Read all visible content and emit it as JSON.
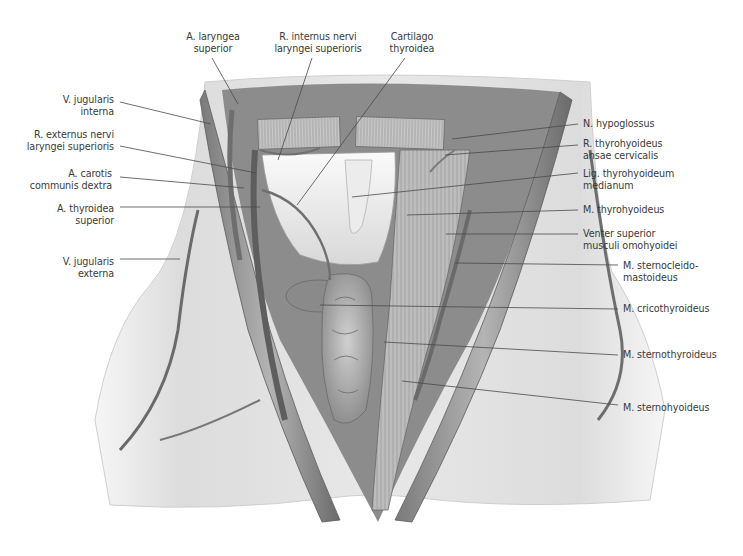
{
  "figure": {
    "colors": {
      "background": "#ffffff",
      "label_text": "#3a3a3a",
      "leader_line": "#4a4a4a",
      "skin": "#e6e6e6",
      "muscle": "#9a9a9a",
      "vessel": "#6e6e6e",
      "thyroid_gland": "#a8a8a8",
      "cartilage": "#f2f2f2"
    }
  },
  "labels": {
    "top": [
      {
        "id": "a-laryngea-superior",
        "lines": [
          "A. laryngea",
          "superior"
        ]
      },
      {
        "id": "r-internus-nervi",
        "lines": [
          "R. internus nervi",
          "laryngei superioris"
        ]
      },
      {
        "id": "cartilago-thyroidea",
        "lines": [
          "Cartilago",
          "thyroidea"
        ]
      }
    ],
    "left": [
      {
        "id": "v-jugularis-interna",
        "lines": [
          "V. jugularis",
          "interna"
        ]
      },
      {
        "id": "r-externus-nervi",
        "lines": [
          "R. externus nervi",
          "laryngei superioris"
        ]
      },
      {
        "id": "a-carotis-communis",
        "lines": [
          "A. carotis",
          "communis dextra"
        ]
      },
      {
        "id": "a-thyroidea-superior",
        "lines": [
          "A. thyroidea",
          "superior"
        ]
      },
      {
        "id": "v-jugularis-externa",
        "lines": [
          "V. jugularis",
          "externa"
        ]
      }
    ],
    "right": [
      {
        "id": "n-hypoglossus",
        "lines": [
          "N. hypoglossus"
        ]
      },
      {
        "id": "r-thyrohyoideus",
        "lines": [
          "R. thyrohyoideus",
          "ansae cervicalis"
        ]
      },
      {
        "id": "lig-thyrohyoideum",
        "lines": [
          "Lig. thyrohyoideum",
          "medianum"
        ]
      },
      {
        "id": "m-thyrohyoideus",
        "lines": [
          "M. thyrohyoideus"
        ]
      },
      {
        "id": "venter-superior",
        "lines": [
          "Venter superior",
          "musculi omohyoidei"
        ]
      },
      {
        "id": "m-sternocleidomastoideus",
        "lines": [
          "M. sternocleido-",
          "mastoideus"
        ]
      },
      {
        "id": "m-cricothyroideus",
        "lines": [
          "M. cricothyroideus"
        ]
      },
      {
        "id": "m-sternothyroideus",
        "lines": [
          "M. sternothyroideus"
        ]
      },
      {
        "id": "m-sternohyoideus",
        "lines": [
          "M. sternohyoideus"
        ]
      }
    ]
  }
}
